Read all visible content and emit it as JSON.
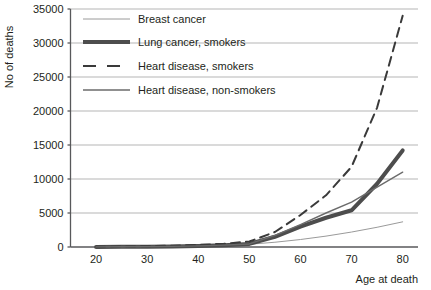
{
  "chart_data": {
    "type": "line",
    "title": "",
    "xlabel": "Age at death",
    "ylabel": "No of deaths",
    "xlim": [
      15,
      83
    ],
    "ylim": [
      0,
      35000
    ],
    "xticks": [
      20,
      30,
      40,
      50,
      60,
      70,
      80
    ],
    "yticks": [
      0,
      5000,
      10000,
      15000,
      20000,
      25000,
      30000,
      35000
    ],
    "grid": "horizontal",
    "legend_position": "top-left",
    "x": [
      20,
      25,
      30,
      35,
      40,
      45,
      50,
      55,
      60,
      65,
      70,
      75,
      80
    ],
    "series": [
      {
        "name": "Breast cancer",
        "style": "thin-light",
        "color": "#9a9a9a",
        "width": 1,
        "dash": "",
        "values": [
          20,
          40,
          70,
          110,
          170,
          260,
          400,
          700,
          1100,
          1600,
          2200,
          2900,
          3700
        ]
      },
      {
        "name": "Lung cancer, smokers",
        "style": "thick",
        "color": "#4d4d4d",
        "width": 4,
        "dash": "",
        "values": [
          10,
          20,
          40,
          80,
          150,
          260,
          450,
          1500,
          3000,
          4300,
          5400,
          9300,
          14200
        ]
      },
      {
        "name": "Heart disease, smokers",
        "style": "dashed",
        "color": "#3a3a3a",
        "width": 2,
        "dash": "9,6",
        "values": [
          30,
          60,
          110,
          190,
          300,
          480,
          800,
          2200,
          4700,
          7600,
          11800,
          20500,
          34000
        ]
      },
      {
        "name": "Heart disease, non-smokers",
        "style": "thin-medium",
        "color": "#6b6b6b",
        "width": 1.4,
        "dash": "",
        "values": [
          15,
          30,
          55,
          95,
          160,
          270,
          450,
          1700,
          3300,
          5000,
          6600,
          8800,
          11000
        ]
      }
    ]
  },
  "legend": {
    "items": [
      {
        "label": "Breast cancer"
      },
      {
        "label": "Lung cancer, smokers"
      },
      {
        "label": "Heart disease, smokers"
      },
      {
        "label": "Heart disease, non-smokers"
      }
    ]
  },
  "axes": {
    "y_title": "No of deaths",
    "x_title": "Age at death",
    "y_tick_labels": [
      "35000",
      "30000",
      "25000",
      "20000",
      "15000",
      "10000",
      "5000",
      "0"
    ],
    "x_tick_labels": [
      "20",
      "30",
      "40",
      "50",
      "60",
      "70",
      "80"
    ]
  },
  "colors": {
    "axis": "#58595b",
    "grid": "#b5b5b5",
    "text": "#231f20",
    "background": "#ffffff"
  }
}
